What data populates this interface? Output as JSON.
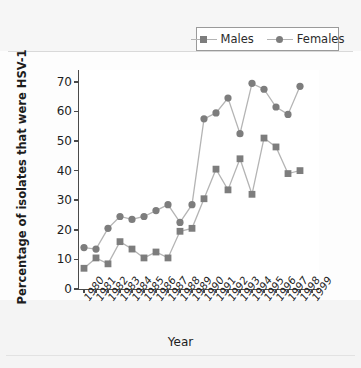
{
  "chart_data": {
    "type": "line",
    "title": "",
    "xlabel": "Year",
    "ylabel": "Percentage of isolates that were HSV-1",
    "grid": false,
    "legend_position": "top-right",
    "ylim": [
      0,
      74
    ],
    "yticks": [
      0,
      10,
      20,
      30,
      40,
      50,
      60,
      70
    ],
    "categories": [
      "1980",
      "1981",
      "1982",
      "1983",
      "1984",
      "1985",
      "1986",
      "1987",
      "1988",
      "1989",
      "1990",
      "1991",
      "1992",
      "1993",
      "1994",
      "1995",
      "1996",
      "1997",
      "1998",
      "1999"
    ],
    "series": [
      {
        "name": "Males",
        "marker": "square",
        "color": "#7d7d7d",
        "values": [
          7,
          10.5,
          8.5,
          16,
          13.5,
          10.5,
          12.5,
          10.5,
          19.5,
          20.5,
          30.5,
          40.5,
          33.5,
          44,
          32,
          51,
          48,
          39,
          40,
          null
        ]
      },
      {
        "name": "Females",
        "marker": "circle",
        "color": "#7d7d7d",
        "values": [
          14,
          13.5,
          20.5,
          24.5,
          23.5,
          24.5,
          26.5,
          28.5,
          22.5,
          28.5,
          57.5,
          59.5,
          64.5,
          52.5,
          69.5,
          67.5,
          61.5,
          59,
          68.5,
          null
        ]
      }
    ]
  },
  "legend": {
    "items": [
      {
        "label": "Males",
        "marker": "square-marker"
      },
      {
        "label": "Females",
        "marker": "circle-marker"
      }
    ]
  },
  "colors": {
    "marker": "#7d7d7d",
    "line": "#b4b4b4",
    "axis": "#4a4a4a",
    "plot_background": "#ffffff",
    "page_background": "#fdfdfd"
  }
}
